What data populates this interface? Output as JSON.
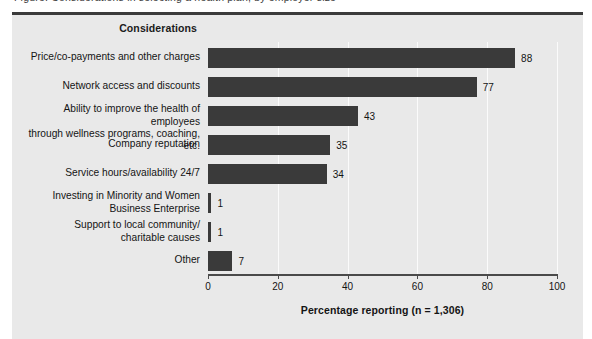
{
  "figure": {
    "clipped_caption": "Figure. Considerations in selecting a health plan, by employer size",
    "column_header": "Considerations"
  },
  "chart_data": {
    "type": "bar",
    "orientation": "horizontal",
    "title": "",
    "xlabel": "Percentage reporting (n = 1,306)",
    "ylabel": "Considerations",
    "xlim": [
      0,
      100
    ],
    "xticks": [
      0,
      20,
      40,
      60,
      80,
      100
    ],
    "grid": true,
    "legend": "none",
    "bar_color": "#3a3a3a",
    "plot_background": "#e9e9e9",
    "categories": [
      "Price/co-payments and other charges",
      "Network access and discounts",
      "Ability to improve the health of employees\nthrough wellness programs, coaching, etc.",
      "Company reputation",
      "Service hours/availability 24/7",
      "Investing in Minority and Women\nBusiness Enterprise",
      "Support to local community/\ncharitable causes",
      "Other"
    ],
    "values": [
      88,
      77,
      43,
      35,
      34,
      1,
      1,
      7
    ],
    "value_labels": [
      "88",
      "77",
      "43",
      "35",
      "34",
      "1",
      "1",
      "7"
    ]
  },
  "categories_lines": [
    [
      "Price/co-payments and other charges"
    ],
    [
      "Network access and discounts"
    ],
    [
      "Ability to improve the health of employees",
      "through wellness programs, coaching, etc."
    ],
    [
      "Company reputation"
    ],
    [
      "Service hours/availability 24/7"
    ],
    [
      "Investing in Minority and Women",
      "Business Enterprise"
    ],
    [
      "Support to local community/",
      "charitable causes"
    ],
    [
      "Other"
    ]
  ]
}
